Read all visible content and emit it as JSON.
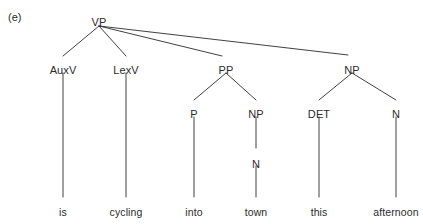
{
  "figure": {
    "tag": "(e)",
    "ink_color": "#2b2b2b",
    "background_color": "#ffffff",
    "width": 423,
    "height": 224
  },
  "tree": {
    "root": {
      "label": "VP",
      "x": 99,
      "y": 16
    },
    "nodes": [
      {
        "id": "auxv",
        "label": "AuxV",
        "x": 63,
        "y": 64
      },
      {
        "id": "lexv",
        "label": "LexV",
        "x": 126,
        "y": 64
      },
      {
        "id": "pp",
        "label": "PP",
        "x": 226,
        "y": 64
      },
      {
        "id": "np2",
        "label": "NP",
        "x": 352,
        "y": 64
      },
      {
        "id": "p",
        "label": "P",
        "x": 194,
        "y": 108
      },
      {
        "id": "np1",
        "label": "NP",
        "x": 256,
        "y": 108
      },
      {
        "id": "det",
        "label": "DET",
        "x": 319,
        "y": 108
      },
      {
        "id": "n2",
        "label": "N",
        "x": 396,
        "y": 108
      },
      {
        "id": "n1",
        "label": "N",
        "x": 256,
        "y": 158
      }
    ],
    "terminals": [
      {
        "id": "word-is",
        "label": "is",
        "x": 63,
        "y": 206
      },
      {
        "id": "word-cycling",
        "label": "cycling",
        "x": 126,
        "y": 206
      },
      {
        "id": "word-into",
        "label": "into",
        "x": 194,
        "y": 206
      },
      {
        "id": "word-town",
        "label": "town",
        "x": 256,
        "y": 206
      },
      {
        "id": "word-this",
        "label": "this",
        "x": 319,
        "y": 206
      },
      {
        "id": "word-afternoon",
        "label": "afternoon",
        "x": 396,
        "y": 206
      }
    ],
    "edges": [
      {
        "id": "vp-auxv",
        "x1": 99,
        "y1": 26,
        "x2": 63,
        "y2": 56
      },
      {
        "id": "vp-lexv",
        "x1": 99,
        "y1": 26,
        "x2": 126,
        "y2": 56
      },
      {
        "id": "vp-pp",
        "x1": 99,
        "y1": 26,
        "x2": 222,
        "y2": 56
      },
      {
        "id": "vp-np2",
        "x1": 99,
        "y1": 26,
        "x2": 348,
        "y2": 55
      },
      {
        "id": "auxv-is",
        "x1": 63,
        "y1": 73,
        "x2": 63,
        "y2": 197
      },
      {
        "id": "lexv-cyc",
        "x1": 126,
        "y1": 73,
        "x2": 126,
        "y2": 197
      },
      {
        "id": "pp-p",
        "x1": 226,
        "y1": 73,
        "x2": 194,
        "y2": 100
      },
      {
        "id": "pp-np1",
        "x1": 226,
        "y1": 73,
        "x2": 256,
        "y2": 100
      },
      {
        "id": "np2-det",
        "x1": 352,
        "y1": 73,
        "x2": 319,
        "y2": 100
      },
      {
        "id": "np2-n2",
        "x1": 352,
        "y1": 73,
        "x2": 396,
        "y2": 100
      },
      {
        "id": "p-into",
        "x1": 194,
        "y1": 117,
        "x2": 194,
        "y2": 197
      },
      {
        "id": "np1-n1",
        "x1": 256,
        "y1": 117,
        "x2": 256,
        "y2": 148
      },
      {
        "id": "n1-town",
        "x1": 256,
        "y1": 166,
        "x2": 256,
        "y2": 197
      },
      {
        "id": "det-this",
        "x1": 319,
        "y1": 117,
        "x2": 319,
        "y2": 197
      },
      {
        "id": "n2-aftn",
        "x1": 396,
        "y1": 117,
        "x2": 396,
        "y2": 197
      }
    ]
  }
}
